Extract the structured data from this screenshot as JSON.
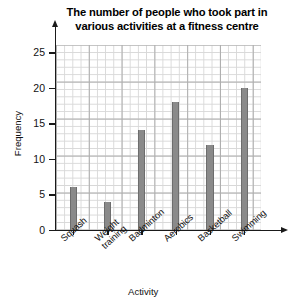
{
  "chart_data": {
    "type": "bar",
    "title": "The number of people who took part in various activities at a fitness centre",
    "title_line1": "The number of people who took part in",
    "title_line2": "various activities at a fitness centre",
    "xlabel": "Activity",
    "ylabel": "Frequency",
    "categories": [
      "Squash",
      "Weight\ntraining",
      "Badminton",
      "Aerobics",
      "Basketball",
      "Swimming"
    ],
    "values": [
      6,
      4,
      14,
      18,
      12,
      20
    ],
    "ylim": [
      0,
      26
    ],
    "ytick_labels": [
      "0",
      "5",
      "10",
      "15",
      "20",
      "25"
    ],
    "ytick_values": [
      0,
      5,
      10,
      15,
      20,
      25
    ],
    "grid": true,
    "grid_minor_step": 1,
    "grid_major_step": 5,
    "legend": "none",
    "bar_color": "#8a8a8a",
    "axis_color": "#1a1a1a",
    "grid_minor_color": "#d8d8d8",
    "grid_major_color": "#aeaeae",
    "background_color": "#ffffff"
  }
}
